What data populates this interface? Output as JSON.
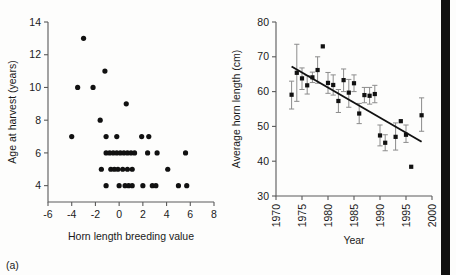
{
  "figure": {
    "background": "#fdfdfc",
    "ink": "#111111",
    "axis_color": "#5a5a5a",
    "errorbar_color": "#8c8c8c",
    "scan_edge": {
      "x": 441,
      "width": 9,
      "color": "#111111"
    }
  },
  "panels": [
    {
      "letter": "(a)",
      "chart_data": {
        "type": "scatter",
        "title": "",
        "xlabel": "Horn length breeding value",
        "ylabel": "Age at harvest (years)",
        "xlim": [
          -6,
          8
        ],
        "ylim": [
          3,
          14
        ],
        "xticks": [
          -6,
          -4,
          -2,
          0,
          2,
          4,
          6,
          8
        ],
        "xticklabels": [
          "-6",
          "-4",
          "-2",
          "0",
          "2",
          "4",
          "6",
          "8"
        ],
        "yticks": [
          4,
          6,
          8,
          10,
          12,
          14
        ],
        "yticklabels": [
          "4",
          "6",
          "8",
          "10",
          "12",
          "14"
        ],
        "grid": false,
        "legend": "none",
        "points": [
          [
            -3.0,
            13
          ],
          [
            -1.2,
            11
          ],
          [
            -3.5,
            10
          ],
          [
            -2.2,
            10
          ],
          [
            0.6,
            9
          ],
          [
            -1.6,
            8
          ],
          [
            -4.0,
            7
          ],
          [
            -1.1,
            7
          ],
          [
            -0.2,
            7
          ],
          [
            1.9,
            7
          ],
          [
            2.5,
            7
          ],
          [
            -1.1,
            6
          ],
          [
            -0.8,
            6
          ],
          [
            -0.5,
            6
          ],
          [
            -0.2,
            6
          ],
          [
            0.1,
            6
          ],
          [
            0.4,
            6
          ],
          [
            0.7,
            6
          ],
          [
            1.0,
            6
          ],
          [
            1.3,
            6
          ],
          [
            2.4,
            6
          ],
          [
            3.2,
            6
          ],
          [
            5.6,
            6
          ],
          [
            -1.5,
            5
          ],
          [
            -0.7,
            5
          ],
          [
            -0.4,
            5
          ],
          [
            -0.1,
            5
          ],
          [
            0.3,
            5
          ],
          [
            0.7,
            5
          ],
          [
            1.1,
            5
          ],
          [
            4.1,
            5
          ],
          [
            -1.1,
            4
          ],
          [
            0.0,
            4
          ],
          [
            0.5,
            4
          ],
          [
            0.8,
            4
          ],
          [
            1.1,
            4
          ],
          [
            2.0,
            4
          ],
          [
            2.8,
            4
          ],
          [
            3.1,
            4
          ],
          [
            5.0,
            4
          ],
          [
            5.7,
            4
          ]
        ]
      }
    },
    {
      "letter": "(b)",
      "chart_data": {
        "type": "scatter",
        "title": "",
        "xlabel": "Year",
        "ylabel": "Average horn length (cm)",
        "xlim": [
          1970,
          2000
        ],
        "ylim": [
          30,
          80
        ],
        "xticks": [
          1970,
          1975,
          1980,
          1985,
          1990,
          1995,
          2000
        ],
        "xticklabels": [
          "1970",
          "1975",
          "1980",
          "1985",
          "1990",
          "1995",
          "2000"
        ],
        "yticks": [
          30,
          40,
          50,
          60,
          70,
          80
        ],
        "yticklabels": [
          "30",
          "40",
          "50",
          "60",
          "70",
          "80"
        ],
        "grid": false,
        "legend": "none",
        "errorbars": true,
        "series": [
          {
            "name": "Average horn length",
            "points": [
              {
                "x": 1973,
                "y": 59.1,
                "lo": 55.0,
                "hi": 63.0
              },
              {
                "x": 1974,
                "y": 65.4,
                "lo": 57.2,
                "hi": 73.6
              },
              {
                "x": 1975,
                "y": 63.8,
                "lo": 60.6,
                "hi": 66.8
              },
              {
                "x": 1976,
                "y": 61.8,
                "lo": 59.3,
                "hi": 64.6
              },
              {
                "x": 1977,
                "y": 64.1,
                "lo": 62.6,
                "hi": 65.6
              },
              {
                "x": 1978,
                "y": 66.2,
                "lo": 62.4,
                "hi": 70.0
              },
              {
                "x": 1979,
                "y": 73.0,
                "lo": 73.0,
                "hi": 73.0
              },
              {
                "x": 1980,
                "y": 62.5,
                "lo": 59.5,
                "hi": 65.5
              },
              {
                "x": 1981,
                "y": 61.9,
                "lo": 59.0,
                "hi": 64.8
              },
              {
                "x": 1982,
                "y": 57.3,
                "lo": 54.0,
                "hi": 60.6
              },
              {
                "x": 1983,
                "y": 63.3,
                "lo": 60.0,
                "hi": 66.5
              },
              {
                "x": 1984,
                "y": 59.7,
                "lo": 55.5,
                "hi": 63.5
              },
              {
                "x": 1985,
                "y": 62.4,
                "lo": 60.0,
                "hi": 64.8
              },
              {
                "x": 1986,
                "y": 53.7,
                "lo": 50.8,
                "hi": 56.6
              },
              {
                "x": 1987,
                "y": 59.0,
                "lo": 56.8,
                "hi": 61.2
              },
              {
                "x": 1988,
                "y": 58.8,
                "lo": 56.4,
                "hi": 61.2
              },
              {
                "x": 1989,
                "y": 59.3,
                "lo": 56.8,
                "hi": 61.8
              },
              {
                "x": 1990,
                "y": 47.4,
                "lo": 44.4,
                "hi": 50.4
              },
              {
                "x": 1991,
                "y": 45.3,
                "lo": 43.0,
                "hi": 47.6
              },
              {
                "x": 1993,
                "y": 47.0,
                "lo": 43.2,
                "hi": 51.0
              },
              {
                "x": 1994,
                "y": 51.5,
                "lo": 51.5,
                "hi": 51.5
              },
              {
                "x": 1995,
                "y": 47.6,
                "lo": 45.4,
                "hi": 50.4
              },
              {
                "x": 1996,
                "y": 38.4,
                "lo": 38.4,
                "hi": 38.4
              },
              {
                "x": 1998,
                "y": 53.2,
                "lo": 48.6,
                "hi": 58.2
              }
            ]
          }
        ],
        "trendline": {
          "x0": 1973.0,
          "y0": 67.2,
          "x1": 1998.0,
          "y1": 45.6
        }
      }
    }
  ]
}
